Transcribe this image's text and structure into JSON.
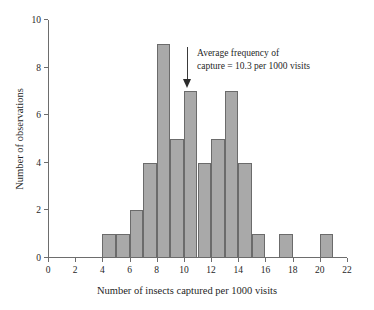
{
  "chart_data": {
    "type": "bar",
    "title": "",
    "subtitle": "",
    "xlabel": "Number of insects captured per 1000 visits",
    "ylabel": "Number of observations",
    "xlim": [
      0,
      22
    ],
    "ylim": [
      0,
      10
    ],
    "xticks": [
      0,
      2,
      4,
      6,
      8,
      10,
      12,
      14,
      16,
      18,
      20,
      22
    ],
    "yticks": [
      0,
      2,
      4,
      6,
      8,
      10
    ],
    "xtick_labels": [
      "0",
      "2",
      "4",
      "6",
      "8",
      "10",
      "12",
      "14",
      "16",
      "18",
      "20",
      "22"
    ],
    "ytick_labels": [
      "0",
      "2",
      "4",
      "6",
      "8",
      "10"
    ],
    "grid": false,
    "legend": null,
    "bin_width": 1,
    "bins": [
      {
        "start": 4,
        "end": 5,
        "value": 1
      },
      {
        "start": 5,
        "end": 6,
        "value": 1
      },
      {
        "start": 6,
        "end": 7,
        "value": 2
      },
      {
        "start": 7,
        "end": 8,
        "value": 4
      },
      {
        "start": 8,
        "end": 9,
        "value": 9
      },
      {
        "start": 9,
        "end": 10,
        "value": 5
      },
      {
        "start": 10,
        "end": 11,
        "value": 7
      },
      {
        "start": 11,
        "end": 12,
        "value": 4
      },
      {
        "start": 12,
        "end": 13,
        "value": 5
      },
      {
        "start": 13,
        "end": 14,
        "value": 7
      },
      {
        "start": 14,
        "end": 15,
        "value": 4
      },
      {
        "start": 15,
        "end": 16,
        "value": 1
      },
      {
        "start": 17,
        "end": 18,
        "value": 1
      },
      {
        "start": 20,
        "end": 21,
        "value": 1
      }
    ],
    "categories": [
      "4-5",
      "5-6",
      "6-7",
      "7-8",
      "8-9",
      "9-10",
      "10-11",
      "11-12",
      "12-13",
      "13-14",
      "14-15",
      "15-16",
      "17-18",
      "20-21"
    ],
    "values": [
      1,
      1,
      2,
      4,
      9,
      5,
      7,
      4,
      5,
      7,
      4,
      1,
      1,
      1
    ],
    "annotations": [
      {
        "name": "mean-marker",
        "lines": [
          "Average frequency of",
          "capture = 10.3 per 1000 visits"
        ],
        "x_value": 10.3,
        "arrow": "down"
      }
    ],
    "colors": {
      "bar_fill": "#a9a9a9",
      "bar_stroke": "#6b6b6b",
      "axis": "#6d6d6d",
      "text": "#1f1f1f",
      "background": "#ffffff"
    }
  }
}
